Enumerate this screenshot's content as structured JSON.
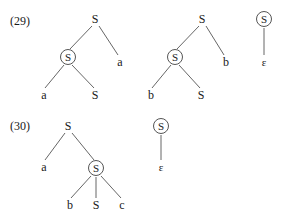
{
  "page": {
    "background_color": "#ffffff",
    "text_color": "#1a1a1a",
    "line_color": "#555555",
    "width": 287,
    "height": 220
  },
  "examples": [
    {
      "id": "29",
      "label": "(29)",
      "label_x": 10,
      "label_y": 15,
      "trees": [
        {
          "name": "tree-29-a",
          "nodes": [
            {
              "name": "root-S",
              "text": "S",
              "x": 95,
              "y": 19,
              "circled": false
            },
            {
              "name": "inner-S",
              "text": "S",
              "x": 68,
              "y": 57,
              "circled": true
            },
            {
              "name": "right-leaf-a",
              "text": "a",
              "x": 120,
              "y": 62,
              "circled": false
            },
            {
              "name": "leaf-a",
              "text": "a",
              "x": 44,
              "y": 95,
              "circled": false
            },
            {
              "name": "leaf-S",
              "text": "S",
              "x": 95,
              "y": 95,
              "circled": false
            }
          ],
          "edges": [
            {
              "name": "edge-root-to-inner-S",
              "x1": 92,
              "y1": 26,
              "x2": 70,
              "y2": 49
            },
            {
              "name": "edge-root-to-a",
              "x1": 99,
              "y1": 26,
              "x2": 118,
              "y2": 55
            },
            {
              "name": "edge-innerS-to-a",
              "x1": 64,
              "y1": 65,
              "x2": 45,
              "y2": 88
            },
            {
              "name": "edge-innerS-to-S",
              "x1": 72,
              "y1": 65,
              "x2": 94,
              "y2": 88
            }
          ]
        },
        {
          "name": "tree-29-b",
          "nodes": [
            {
              "name": "root-S",
              "text": "S",
              "x": 202,
              "y": 19,
              "circled": false
            },
            {
              "name": "inner-S",
              "text": "S",
              "x": 175,
              "y": 57,
              "circled": true
            },
            {
              "name": "right-leaf-b",
              "text": "b",
              "x": 226,
              "y": 62,
              "circled": false
            },
            {
              "name": "leaf-b",
              "text": "b",
              "x": 151,
              "y": 95,
              "circled": false
            },
            {
              "name": "leaf-S",
              "text": "S",
              "x": 201,
              "y": 95,
              "circled": false
            }
          ],
          "edges": [
            {
              "name": "edge-root-to-inner-S",
              "x1": 199,
              "y1": 26,
              "x2": 177,
              "y2": 49
            },
            {
              "name": "edge-root-to-b",
              "x1": 206,
              "y1": 26,
              "x2": 224,
              "y2": 55
            },
            {
              "name": "edge-innerS-to-b",
              "x1": 171,
              "y1": 65,
              "x2": 152,
              "y2": 88
            },
            {
              "name": "edge-innerS-to-S",
              "x1": 179,
              "y1": 65,
              "x2": 200,
              "y2": 88
            }
          ]
        },
        {
          "name": "tree-29-c",
          "nodes": [
            {
              "name": "root-S",
              "text": "S",
              "x": 264,
              "y": 19,
              "circled": true
            },
            {
              "name": "leaf-epsilon",
              "text": "ε",
              "x": 264,
              "y": 62,
              "circled": false
            }
          ],
          "edges": [
            {
              "name": "edge-root-to-epsilon",
              "x1": 264,
              "y1": 28,
              "x2": 264,
              "y2": 55
            }
          ]
        }
      ]
    },
    {
      "id": "30",
      "label": "(30)",
      "label_x": 10,
      "label_y": 120,
      "trees": [
        {
          "name": "tree-30-a",
          "nodes": [
            {
              "name": "root-S",
              "text": "S",
              "x": 68,
              "y": 126,
              "circled": false
            },
            {
              "name": "left-leaf-a",
              "text": "a",
              "x": 44,
              "y": 167,
              "circled": false
            },
            {
              "name": "inner-S",
              "text": "S",
              "x": 96,
              "y": 168,
              "circled": true
            },
            {
              "name": "leaf-b",
              "text": "b",
              "x": 70,
              "y": 205,
              "circled": false
            },
            {
              "name": "leaf-S",
              "text": "S",
              "x": 96,
              "y": 205,
              "circled": false
            },
            {
              "name": "leaf-c",
              "text": "c",
              "x": 122,
              "y": 205,
              "circled": false
            }
          ],
          "edges": [
            {
              "name": "edge-root-to-a",
              "x1": 65,
              "y1": 133,
              "x2": 45,
              "y2": 160
            },
            {
              "name": "edge-root-to-innerS",
              "x1": 72,
              "y1": 133,
              "x2": 94,
              "y2": 160
            },
            {
              "name": "edge-innerS-to-b",
              "x1": 91,
              "y1": 176,
              "x2": 71,
              "y2": 198
            },
            {
              "name": "edge-innerS-to-S",
              "x1": 96,
              "y1": 177,
              "x2": 96,
              "y2": 198
            },
            {
              "name": "edge-innerS-to-c",
              "x1": 101,
              "y1": 176,
              "x2": 121,
              "y2": 198
            }
          ]
        },
        {
          "name": "tree-30-b",
          "nodes": [
            {
              "name": "root-S",
              "text": "S",
              "x": 161,
              "y": 126,
              "circled": true
            },
            {
              "name": "leaf-epsilon",
              "text": "ε",
              "x": 161,
              "y": 167,
              "circled": false
            }
          ],
          "edges": [
            {
              "name": "edge-root-to-epsilon",
              "x1": 161,
              "y1": 135,
              "x2": 161,
              "y2": 160
            }
          ]
        }
      ]
    }
  ]
}
